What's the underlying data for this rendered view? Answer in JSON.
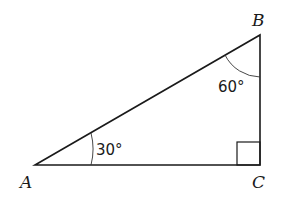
{
  "diagram": {
    "type": "right-triangle",
    "vertices": [
      {
        "id": "A",
        "label": "A",
        "x": 35,
        "y": 165
      },
      {
        "id": "B",
        "label": "B",
        "x": 260,
        "y": 35
      },
      {
        "id": "C",
        "label": "C",
        "x": 260,
        "y": 165
      }
    ],
    "angles": [
      {
        "at": "A",
        "label": "30°"
      },
      {
        "at": "B",
        "label": "60°"
      },
      {
        "at": "C",
        "label": "",
        "right_angle": true
      }
    ],
    "colors": {
      "stroke": "#1a1a1a",
      "background": "#ffffff"
    }
  }
}
